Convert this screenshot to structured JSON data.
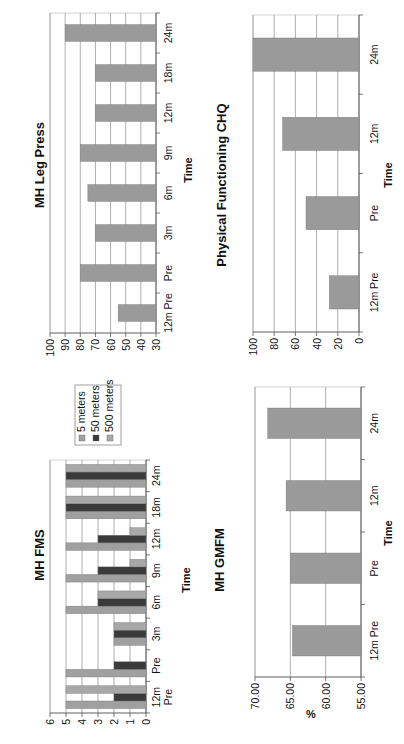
{
  "chart_data": [
    {
      "id": "fms",
      "type": "bar",
      "title": "MH FMS",
      "xlabel": "Time",
      "ylabel": "",
      "categories": [
        "12m Pre",
        "Pre",
        "3m",
        "6m",
        "9m",
        "12m",
        "18m",
        "24m"
      ],
      "series": [
        {
          "name": "5 meters",
          "color": "#a0a0a0",
          "values": [
            5,
            5,
            2,
            5,
            5,
            5,
            5,
            5
          ]
        },
        {
          "name": "50 meters",
          "color": "#3a3a3a",
          "values": [
            2,
            2,
            2,
            3,
            3,
            3,
            5,
            5
          ]
        },
        {
          "name": "500 meters",
          "color": "#a8a8a8",
          "values": [
            5,
            0,
            2,
            3,
            1,
            1,
            5,
            5
          ]
        }
      ],
      "ylim": [
        0,
        6
      ],
      "yticks": [
        "0",
        "1",
        "2",
        "3",
        "4",
        "5",
        "6"
      ],
      "grid": true,
      "legend_position": "right"
    },
    {
      "id": "legpress",
      "type": "bar",
      "title": "MH Leg Press",
      "xlabel": "Time",
      "ylabel": "",
      "categories": [
        "12m Pre",
        "Pre",
        "3m",
        "6m",
        "9m",
        "12m",
        "18m",
        "24m"
      ],
      "values": [
        55,
        80,
        70,
        75,
        80,
        70,
        70,
        90
      ],
      "color": "#9a9a9a",
      "ylim": [
        30,
        100
      ],
      "yticks": [
        "30",
        "40",
        "50",
        "60",
        "70",
        "80",
        "90",
        "100"
      ],
      "grid": true
    },
    {
      "id": "gmfm",
      "type": "bar",
      "title": "MH GMFM",
      "xlabel": "Time",
      "ylabel": "%",
      "categories": [
        "12m Pre",
        "Pre",
        "12m",
        "24m"
      ],
      "values": [
        64.7,
        65.0,
        65.6,
        68.2
      ],
      "color": "#9a9a9a",
      "ylim": [
        55,
        70
      ],
      "yticks": [
        "55.00",
        "60.00",
        "65.00",
        "70.00"
      ],
      "grid": true
    },
    {
      "id": "chq",
      "type": "bar",
      "title": "Physical Functioning CHQ",
      "xlabel": "Time",
      "ylabel": "",
      "categories": [
        "12m Pre",
        "Pre",
        "12m",
        "24m"
      ],
      "values": [
        28,
        50,
        72,
        100
      ],
      "color": "#9a9a9a",
      "ylim": [
        0,
        100
      ],
      "yticks": [
        "0",
        "20",
        "40",
        "60",
        "80",
        "100"
      ],
      "grid": true
    }
  ]
}
